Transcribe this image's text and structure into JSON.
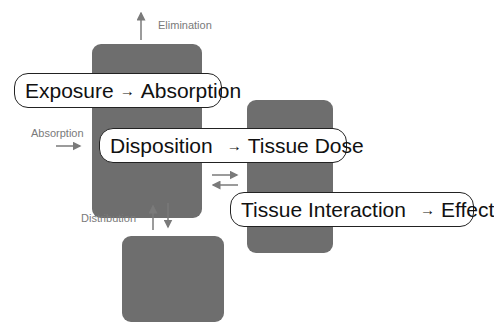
{
  "diagram": {
    "colors": {
      "compartment_fill": "#6e6e6e",
      "label_text": "#7a7a7a",
      "pill_border": "#222222",
      "background": "#ffffff"
    },
    "compartments": [
      {
        "id": "central"
      },
      {
        "id": "tissue"
      },
      {
        "id": "peripheral"
      }
    ],
    "stages": [
      {
        "from": "Exposure",
        "arrow": "→",
        "to": "Absorption"
      },
      {
        "from": "Disposition",
        "arrow": "→",
        "to": "Tissue Dose"
      },
      {
        "from": "Tissue Interaction",
        "arrow": "→",
        "to": "Effect"
      }
    ],
    "flow_labels": {
      "elimination": "Elimination",
      "absorption": "Absorption",
      "distribution": "Distribution"
    }
  }
}
